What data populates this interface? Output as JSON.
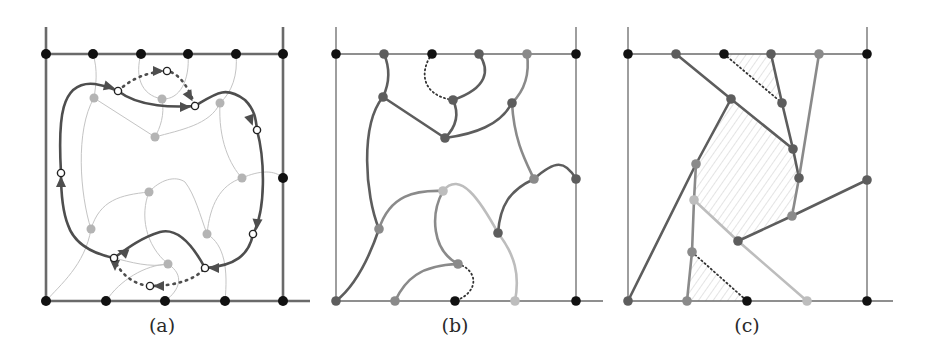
{
  "figure": {
    "panels": [
      {
        "id": "a",
        "caption": "(a)",
        "caption_pos": [
          162,
          332
        ],
        "frame": {
          "left": 46,
          "right": 283,
          "top": 54,
          "bottom": 301,
          "vtop": 27,
          "hright": 310
        },
        "boundary_vertices": [
          {
            "x": 46,
            "y": 54,
            "tone": "black"
          },
          {
            "x": 93,
            "y": 54,
            "tone": "black"
          },
          {
            "x": 141,
            "y": 54,
            "tone": "black"
          },
          {
            "x": 188,
            "y": 54,
            "tone": "black"
          },
          {
            "x": 236,
            "y": 54,
            "tone": "black"
          },
          {
            "x": 283,
            "y": 54,
            "tone": "black"
          },
          {
            "x": 283,
            "y": 178,
            "tone": "black"
          },
          {
            "x": 46,
            "y": 301,
            "tone": "black"
          },
          {
            "x": 106,
            "y": 301,
            "tone": "black"
          },
          {
            "x": 165,
            "y": 301,
            "tone": "black"
          },
          {
            "x": 225,
            "y": 301,
            "tone": "black"
          },
          {
            "x": 283,
            "y": 301,
            "tone": "black"
          }
        ],
        "thin_curves": [
          "M93,54 C98,70 96,85 94,98",
          "M141,54 C135,75 140,95 162,99 C180,100 190,80 188,54",
          "M162,99 C165,115 160,128 155,137",
          "M94,98 L155,137",
          "M155,137 C180,130 210,125 220,103",
          "M236,54 C238,75 232,92 220,103",
          "M220,103 C218,140 230,165 242,178",
          "M242,178 C260,170 275,170 283,178",
          "M94,98 C75,130 80,195 91,229",
          "M91,229 C100,200 120,195 149,192",
          "M149,192 C160,180 175,175 185,182 C195,195 200,215 207,234",
          "M242,178 C220,185 210,205 207,234",
          "M149,192 C140,215 145,245 168,264",
          "M46,301 C60,285 85,265 91,229",
          "M106,301 C120,280 145,265 168,264",
          "M165,301 C180,290 185,275 168,264",
          "M207,234 C225,245 228,270 225,301",
          "M168,264 C150,268 130,262 114,258"
        ],
        "loop_path": "M61,173 C58,120 60,80 95,84 C108,86 113,89 118,91 C140,108 175,107 195,106 C215,94 225,85 245,100 C255,110 256,120 257,130 C265,160 266,210 253,234 C249,255 235,266 205,268 C190,240 175,228 160,232 C140,238 125,250 114,258 C95,254 75,246 68,225 C62,210 61,190 61,173 Z",
        "dotted_paths": [
          "M118,91 C130,80 145,72 167,71 C180,73 190,90 195,106",
          "M114,258 C120,275 135,285 150,286 C175,286 195,280 205,268"
        ],
        "open_circles": [
          {
            "x": 118,
            "y": 91
          },
          {
            "x": 195,
            "y": 106
          },
          {
            "x": 257,
            "y": 130
          },
          {
            "x": 61,
            "y": 173
          },
          {
            "x": 253,
            "y": 234
          },
          {
            "x": 205,
            "y": 268
          },
          {
            "x": 114,
            "y": 258
          },
          {
            "x": 150,
            "y": 286
          },
          {
            "x": 167,
            "y": 71
          }
        ],
        "arrowheads": [
          {
            "x": 110,
            "y": 87,
            "angle": 15
          },
          {
            "x": 186,
            "y": 107,
            "angle": 0
          },
          {
            "x": 190,
            "y": 97,
            "angle": 60
          },
          {
            "x": 159,
            "y": 71,
            "angle": 0
          },
          {
            "x": 251,
            "y": 121,
            "angle": 70
          },
          {
            "x": 61,
            "y": 181,
            "angle": -90
          },
          {
            "x": 257,
            "y": 225,
            "angle": 95
          },
          {
            "x": 213,
            "y": 268,
            "angle": 180
          },
          {
            "x": 122,
            "y": 252,
            "angle": 200
          },
          {
            "x": 115,
            "y": 266,
            "angle": 90
          },
          {
            "x": 158,
            "y": 286,
            "angle": 180
          }
        ],
        "inner_vertices": [
          {
            "x": 94,
            "y": 98
          },
          {
            "x": 162,
            "y": 99
          },
          {
            "x": 220,
            "y": 103
          },
          {
            "x": 155,
            "y": 137
          },
          {
            "x": 242,
            "y": 178
          },
          {
            "x": 149,
            "y": 192
          },
          {
            "x": 91,
            "y": 229
          },
          {
            "x": 207,
            "y": 234
          },
          {
            "x": 168,
            "y": 264
          }
        ]
      },
      {
        "id": "b",
        "caption": "(b)",
        "caption_pos": [
          455,
          332
        ],
        "frame": {
          "left": 336,
          "right": 576,
          "top": 54,
          "bottom": 301,
          "vtop": 27,
          "hright": 603
        },
        "vertices": [
          {
            "x": 336,
            "y": 54,
            "tone": "black"
          },
          {
            "x": 384,
            "y": 54,
            "tone": "dark"
          },
          {
            "x": 432,
            "y": 54,
            "tone": "black"
          },
          {
            "x": 479,
            "y": 54,
            "tone": "dark"
          },
          {
            "x": 527,
            "y": 54,
            "tone": "mid"
          },
          {
            "x": 576,
            "y": 54,
            "tone": "black"
          },
          {
            "x": 576,
            "y": 179,
            "tone": "dark"
          },
          {
            "x": 336,
            "y": 301,
            "tone": "dark"
          },
          {
            "x": 395,
            "y": 301,
            "tone": "mid"
          },
          {
            "x": 455,
            "y": 301,
            "tone": "black"
          },
          {
            "x": 515,
            "y": 301,
            "tone": "light"
          },
          {
            "x": 576,
            "y": 301,
            "tone": "black"
          },
          {
            "x": 383,
            "y": 97,
            "tone": "dark"
          },
          {
            "x": 453,
            "y": 100,
            "tone": "dark"
          },
          {
            "x": 445,
            "y": 138,
            "tone": "dark"
          },
          {
            "x": 512,
            "y": 103,
            "tone": "dark"
          },
          {
            "x": 534,
            "y": 179,
            "tone": "mid"
          },
          {
            "x": 379,
            "y": 229,
            "tone": "mid"
          },
          {
            "x": 443,
            "y": 191,
            "tone": "light"
          },
          {
            "x": 498,
            "y": 233,
            "tone": "dark"
          },
          {
            "x": 458,
            "y": 264,
            "tone": "mid"
          }
        ],
        "edges": [
          {
            "d": "M384,54 C390,68 390,82 383,97",
            "tone": "dark"
          },
          {
            "d": "M383,97 L445,138",
            "tone": "dark"
          },
          {
            "d": "M479,54 C490,70 488,88 453,100",
            "tone": "dark"
          },
          {
            "d": "M453,100 C460,115 455,128 445,138",
            "tone": "dark"
          },
          {
            "d": "M445,138 C475,134 500,125 512,103",
            "tone": "dark"
          },
          {
            "d": "M527,54 C530,75 525,90 512,103",
            "tone": "mid"
          },
          {
            "d": "M512,103 C514,140 525,160 534,179",
            "tone": "mid"
          },
          {
            "d": "M534,179 C555,160 565,160 576,179",
            "tone": "dark"
          },
          {
            "d": "M534,179 C510,190 500,205 498,233",
            "tone": "dark"
          },
          {
            "d": "M383,97 C360,125 365,195 379,229",
            "tone": "dark"
          },
          {
            "d": "M379,229 C365,270 350,290 336,301",
            "tone": "dark"
          },
          {
            "d": "M379,229 C390,195 415,190 443,191",
            "tone": "mid"
          },
          {
            "d": "M443,191 C430,215 432,250 458,264",
            "tone": "mid"
          },
          {
            "d": "M443,191 C460,170 480,200 498,233 C515,255 520,275 515,301",
            "tone": "light"
          },
          {
            "d": "M458,264 C420,265 405,280 395,301",
            "tone": "mid"
          }
        ],
        "dotted_paths": [
          "M432,54 C420,70 420,95 453,100",
          "M458,264 C478,270 480,292 455,301"
        ]
      },
      {
        "id": "c",
        "caption": "(c)",
        "caption_pos": [
          747,
          332
        ],
        "frame": {
          "left": 628,
          "right": 867,
          "top": 54,
          "bottom": 301,
          "vtop": 27,
          "hright": 893
        },
        "hatched_regions": [
          "M731,99 L793,149 L799,178 L792,216 L738,241 L694,200 L696,164 Z",
          "M724,54 L771,54 L782,103 Z",
          "M692,252 L687,301 L747,301 Z"
        ],
        "vertices": [
          {
            "x": 628,
            "y": 54,
            "tone": "black"
          },
          {
            "x": 676,
            "y": 54,
            "tone": "dark"
          },
          {
            "x": 724,
            "y": 54,
            "tone": "black"
          },
          {
            "x": 771,
            "y": 54,
            "tone": "dark"
          },
          {
            "x": 819,
            "y": 54,
            "tone": "mid"
          },
          {
            "x": 867,
            "y": 54,
            "tone": "black"
          },
          {
            "x": 867,
            "y": 180,
            "tone": "dark"
          },
          {
            "x": 628,
            "y": 301,
            "tone": "dark"
          },
          {
            "x": 687,
            "y": 301,
            "tone": "mid"
          },
          {
            "x": 747,
            "y": 301,
            "tone": "black"
          },
          {
            "x": 807,
            "y": 301,
            "tone": "light"
          },
          {
            "x": 867,
            "y": 301,
            "tone": "black"
          },
          {
            "x": 731,
            "y": 99,
            "tone": "dark"
          },
          {
            "x": 782,
            "y": 103,
            "tone": "dark"
          },
          {
            "x": 793,
            "y": 149,
            "tone": "dark"
          },
          {
            "x": 799,
            "y": 178,
            "tone": "dark"
          },
          {
            "x": 792,
            "y": 216,
            "tone": "mid"
          },
          {
            "x": 738,
            "y": 241,
            "tone": "dark"
          },
          {
            "x": 696,
            "y": 164,
            "tone": "mid"
          },
          {
            "x": 694,
            "y": 200,
            "tone": "light"
          },
          {
            "x": 692,
            "y": 252,
            "tone": "mid"
          }
        ],
        "edges": [
          {
            "d": "M676,54 L731,99",
            "tone": "dark"
          },
          {
            "d": "M731,99 L793,149",
            "tone": "dark"
          },
          {
            "d": "M771,54 L782,103 L793,149 L799,178",
            "tone": "dark"
          },
          {
            "d": "M819,54 L799,178 L792,216",
            "tone": "mid"
          },
          {
            "d": "M867,180 L792,216 L738,241",
            "tone": "dark"
          },
          {
            "d": "M731,99 L696,164 L628,301",
            "tone": "dark"
          },
          {
            "d": "M696,164 L694,200 L692,252 L687,301",
            "tone": "mid"
          },
          {
            "d": "M694,200 L738,241 L807,301",
            "tone": "light"
          }
        ],
        "dotted_paths": [
          "M724,54 L782,103",
          "M692,252 L747,301"
        ]
      }
    ],
    "colors": {
      "black": "#111111",
      "frame": "#6a6a6a",
      "dark": "#5d5d5d",
      "mid": "#8a8a8a",
      "light": "#bdbdbd",
      "thin": "#c4c4c4",
      "inner_a": "#b4b4b4",
      "loop": "#4e4e4e",
      "hatch": "#c8c8c8"
    }
  }
}
